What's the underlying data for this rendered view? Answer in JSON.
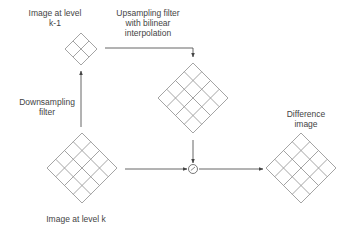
{
  "colors": {
    "grid": "#9a9a9a",
    "arrow": "#555555",
    "text": "#444444",
    "background": "#ffffff"
  },
  "labels": {
    "level_k_minus_1": {
      "line1": "Image at level",
      "line2": "k-1"
    },
    "upsampling": {
      "line1": "Upsampling filter",
      "line2": "with bilinear",
      "line3": "interpolation"
    },
    "downsampling": {
      "line1": "Downsampling",
      "line2": "filter"
    },
    "difference": {
      "line1": "Difference",
      "line2": "image"
    },
    "level_k": {
      "line1": "Image at level k"
    },
    "operator_symbol": "⊖"
  },
  "nodes": [
    {
      "id": "image-level-k-minus-1",
      "grid": 2,
      "cx": 81,
      "cy": 49,
      "r": 16
    },
    {
      "id": "upsampled-image",
      "grid": 4,
      "cx": 193,
      "cy": 98,
      "r": 35
    },
    {
      "id": "image-level-k",
      "grid": 4,
      "cx": 82,
      "cy": 168,
      "r": 35
    },
    {
      "id": "difference-image",
      "grid": 4,
      "cx": 301,
      "cy": 168,
      "r": 35
    }
  ],
  "edges": [
    {
      "from": "image-level-k",
      "to": "image-level-k-minus-1",
      "label": "Downsampling filter"
    },
    {
      "from": "image-level-k-minus-1",
      "to": "upsampled-image",
      "label": "Upsampling filter with bilinear interpolation"
    },
    {
      "from": "upsampled-image",
      "to": "subtract-operator"
    },
    {
      "from": "image-level-k",
      "to": "subtract-operator"
    },
    {
      "from": "subtract-operator",
      "to": "difference-image"
    }
  ]
}
